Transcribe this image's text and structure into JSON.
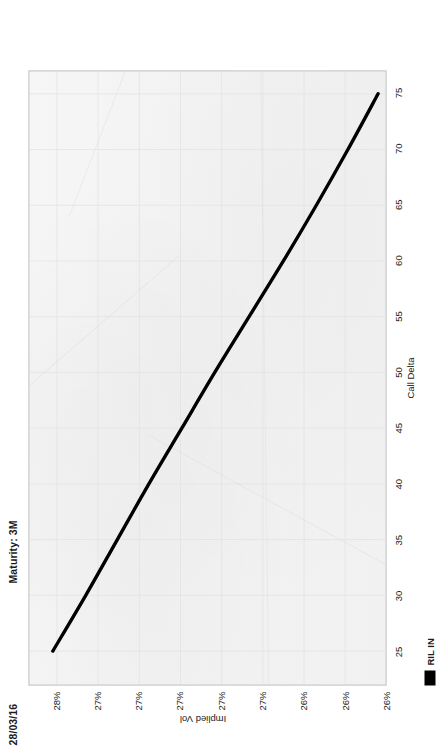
{
  "document": {
    "kind": "scanned-chart-page",
    "orientation_note": "rotated"
  },
  "header": {
    "date": "28/03/16",
    "maturity": "Maturity: 3M"
  },
  "legend": {
    "series_label": "RIL IN",
    "swatch_color": "#000000"
  },
  "colors": {
    "plot_background": "#f4f4f4",
    "plot_border": "#b9b9b9",
    "curve": "#000000",
    "grid": "#e2e2e2",
    "text": "#1b1b1b"
  },
  "chart_data": {
    "type": "line",
    "title": "Maturity: 3M",
    "subtitle": "28/03/16",
    "xlabel": "Call Delta",
    "ylabel": "Implied Vol",
    "xlim": [
      22,
      77
    ],
    "ylim": [
      25.6,
      28.2
    ],
    "grid": true,
    "legend_position": "bottom-left",
    "xticks": [
      25,
      30,
      35,
      40,
      45,
      50,
      55,
      60,
      65,
      70,
      75
    ],
    "xtick_labels": [
      "25",
      "30",
      "35",
      "40",
      "45",
      "50",
      "55",
      "60",
      "65",
      "70",
      "75"
    ],
    "yticks": [
      28.0,
      27.7,
      27.4,
      27.1,
      26.8,
      26.5,
      26.2,
      25.9,
      25.6
    ],
    "ytick_labels": [
      "28%",
      "27%",
      "27%",
      "27%",
      "27%",
      "27%",
      "26%",
      "26%",
      "26%"
    ],
    "series": [
      {
        "name": "RIL IN",
        "color": "#000000",
        "x": [
          25,
          30,
          35,
          40,
          45,
          50,
          55,
          60,
          65,
          70,
          75
        ],
        "y": [
          28.03,
          27.79,
          27.56,
          27.33,
          27.09,
          26.85,
          26.6,
          26.35,
          26.11,
          25.88,
          25.66
        ]
      }
    ]
  }
}
